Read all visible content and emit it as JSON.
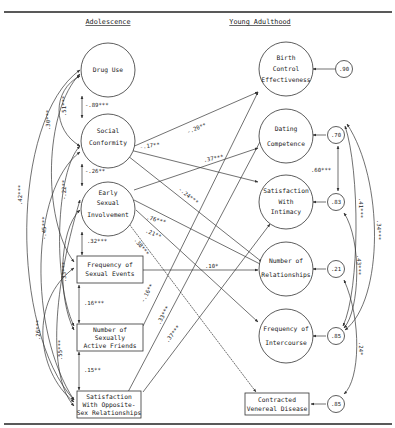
{
  "headers": {
    "left": "Adolescence",
    "right": "Young Adulthood"
  },
  "adolescence_nodes": [
    {
      "id": "drug_use",
      "shape": "circle",
      "lines": [
        "Drug Use"
      ]
    },
    {
      "id": "social_conformity",
      "shape": "circle",
      "lines": [
        "Social",
        "Conformity"
      ]
    },
    {
      "id": "early_sexual",
      "shape": "circle",
      "lines": [
        "Early",
        "Sexual",
        "Involvement"
      ]
    },
    {
      "id": "freq_sexual_events",
      "shape": "box",
      "lines": [
        "Frequency of",
        "Sexual Events"
      ]
    },
    {
      "id": "num_active_friends",
      "shape": "box",
      "lines": [
        "Number of",
        "Sexually",
        "Active Friends"
      ]
    },
    {
      "id": "sat_opposite_sex",
      "shape": "box",
      "lines": [
        "Satisfaction",
        "With Opposite-",
        "Sex Relationships"
      ]
    }
  ],
  "adulthood_nodes": [
    {
      "id": "birth_control",
      "shape": "circle",
      "lines": [
        "Birth",
        "Control",
        "Effectiveness"
      ],
      "residual": ".90"
    },
    {
      "id": "dating_competence",
      "shape": "circle",
      "lines": [
        "Dating",
        "Competence"
      ],
      "residual": ".70"
    },
    {
      "id": "sat_intimacy",
      "shape": "circle",
      "lines": [
        "Satisfaction",
        "With",
        "Intimacy"
      ],
      "residual": ".83"
    },
    {
      "id": "num_relationships",
      "shape": "circle",
      "lines": [
        "Number of",
        "Relationships"
      ],
      "residual": ".21"
    },
    {
      "id": "freq_intercourse",
      "shape": "circle",
      "lines": [
        "Frequency of",
        "Intercourse"
      ],
      "residual": ".85"
    },
    {
      "id": "venereal_disease",
      "shape": "box",
      "lines": [
        "Contracted",
        "Venereal Disease"
      ],
      "residual": ".85"
    }
  ],
  "adjacent_correlations": [
    {
      "from": "drug_use",
      "to": "social_conformity",
      "value": "-.89***"
    },
    {
      "from": "social_conformity",
      "to": "early_sexual",
      "value": "-.26**"
    },
    {
      "from": "early_sexual",
      "to": "freq_sexual_events",
      "value": ".32***"
    },
    {
      "from": "freq_sexual_events",
      "to": "num_active_friends",
      "value": ".16***"
    },
    {
      "from": "num_active_friends",
      "to": "sat_opposite_sex",
      "value": ".15**"
    }
  ],
  "curved_correlations": [
    {
      "label": ".51***"
    },
    {
      "label": ".30***"
    },
    {
      "label": ".42***"
    },
    {
      "label": "-.22**"
    },
    {
      "label": "-.45***"
    },
    {
      "label": ".33***"
    },
    {
      "label": ".26***"
    },
    {
      "label": ".55***"
    }
  ],
  "paths": [
    {
      "from": "social_conformity",
      "to": "birth_control",
      "value": "-.20**"
    },
    {
      "from": "social_conformity",
      "to": "sat_intimacy",
      "value": "-.17**"
    },
    {
      "from": "early_sexual",
      "to": "dating_competence",
      "value": ".37***"
    },
    {
      "from": "social_conformity",
      "to": "num_relationships",
      "value": "-.24***"
    },
    {
      "from": "early_sexual",
      "to": "freq_intercourse",
      "value": ".76***"
    },
    {
      "from": "early_sexual",
      "to": "num_relationships",
      "value": ".21**"
    },
    {
      "from": "early_sexual",
      "to": "venereal_disease",
      "value": ".38***"
    },
    {
      "from": "freq_sexual_events",
      "to": "num_relationships",
      "value": ".10*"
    },
    {
      "from": "num_active_friends",
      "to": "birth_control",
      "value": "-.16**"
    },
    {
      "from": "sat_opposite_sex",
      "to": "dating_competence",
      "value": ".33***"
    },
    {
      "from": "sat_opposite_sex",
      "to": "sat_intimacy",
      "value": ".37***"
    }
  ],
  "residual_correlations": [
    {
      "between": [
        "dating_competence",
        "sat_intimacy"
      ],
      "value": ".60***"
    },
    {
      "between": [
        "dating_competence",
        "freq_intercourse"
      ],
      "value": ".41***"
    },
    {
      "between": [
        "dating_competence",
        "venereal_disease"
      ],
      "value": ".34***"
    },
    {
      "between": [
        "sat_intimacy",
        "freq_intercourse"
      ],
      "value": ".43***"
    },
    {
      "between": [
        "num_relationships",
        "venereal_disease"
      ],
      "value": ".24*"
    }
  ]
}
